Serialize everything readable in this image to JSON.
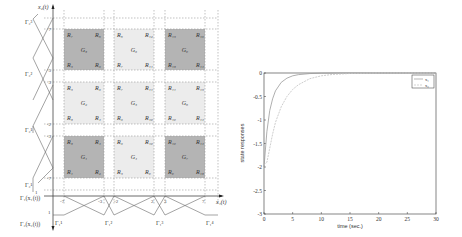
{
  "diagram": {
    "y_axis_label": "x₂(t)",
    "x_axis_label": "x₁(t)",
    "membership_x_label": "Γ₁(x₁(t))",
    "membership_y_label": "Γ₂(x₂(t))",
    "left_membership_labels": [
      "Γ₂³",
      "Γ₂²",
      "Γ₂¹",
      "Γ₂¹"
    ],
    "bottom_membership_labels": [
      "Γ₁¹",
      "Γ₁²",
      "Γ₁³",
      "Γ₁⁴"
    ],
    "y_ticks": [
      "7",
      "5",
      "3",
      "-2",
      "-3",
      "-7"
    ],
    "x_ticks": [
      "-7",
      "-3",
      "-2",
      "2",
      "3",
      "7"
    ],
    "one_labels": [
      "1",
      "1"
    ],
    "cells": [
      {
        "id": "G3",
        "label": "G₃",
        "shade": "dark",
        "corners": [
          "R₇",
          "R₈",
          "R₅",
          "R₆"
        ]
      },
      {
        "id": "G6",
        "label": "G₆",
        "shade": "light",
        "corners": [
          "R₈",
          "R₁₂",
          "R₇",
          "R₁₁"
        ]
      },
      {
        "id": "G9",
        "label": "G₉",
        "shade": "dark",
        "corners": [
          "R₁₅",
          "R₁₆",
          "R₁₃",
          "R₁₄"
        ]
      },
      {
        "id": "G2",
        "label": "G₂",
        "shade": "light",
        "corners": [
          "R₅",
          "R₆",
          "R₃",
          "R₄"
        ]
      },
      {
        "id": "G5",
        "label": "G₅",
        "shade": "light",
        "corners": [
          "R₇",
          "R₁₁",
          "R₆",
          "R₁₀"
        ]
      },
      {
        "id": "G8",
        "label": "G₈",
        "shade": "light",
        "corners": [
          "R₁₁",
          "R₁₅",
          "R₁₀",
          "R₁₄"
        ]
      },
      {
        "id": "G1",
        "label": "G₁",
        "shade": "dark",
        "corners": [
          "R₃",
          "R₄",
          "R₁",
          "R₂"
        ]
      },
      {
        "id": "G4",
        "label": "G₄",
        "shade": "light",
        "corners": [
          "R₆",
          "R₁₀",
          "R₅",
          "R₉"
        ]
      },
      {
        "id": "G7",
        "label": "G₇",
        "shade": "dark",
        "corners": [
          "R₁₀",
          "R₁₄",
          "R₉",
          "R₁₃"
        ]
      }
    ],
    "colors": {
      "dark": "#b4b4b4",
      "light": "#ececec",
      "line": "#555555",
      "grid": "#999999"
    }
  },
  "chart_data": {
    "type": "line",
    "title": "",
    "xlabel": "time (sec.)",
    "ylabel": "state responses",
    "xlim": [
      0,
      30
    ],
    "ylim": [
      -3,
      0
    ],
    "x_ticks": [
      "0",
      "5",
      "10",
      "15",
      "20",
      "25",
      "30"
    ],
    "y_ticks": [
      "0",
      "-0.5",
      "-1",
      "-1.5",
      "-2",
      "-2.5",
      "-3"
    ],
    "grid": false,
    "legend_position": "upper right",
    "x": [
      0,
      0.5,
      1,
      1.5,
      2,
      3,
      4,
      5,
      6,
      8,
      10,
      12,
      15,
      20,
      25,
      30
    ],
    "series": [
      {
        "name": "x₁",
        "values": [
          -2.0,
          -1.25,
          -0.8,
          -0.55,
          -0.38,
          -0.2,
          -0.11,
          -0.06,
          -0.035,
          -0.012,
          -0.004,
          -0.001,
          0,
          0,
          0,
          0
        ]
      },
      {
        "name": "x₂",
        "values": [
          -1.95,
          -1.9,
          -1.6,
          -1.3,
          -1.05,
          -0.72,
          -0.5,
          -0.35,
          -0.25,
          -0.12,
          -0.06,
          -0.03,
          -0.01,
          0,
          0,
          0
        ]
      }
    ],
    "colors": {
      "axes": "#333333",
      "x1": "#9a9a9a",
      "x2": "#c0c0c0"
    }
  }
}
